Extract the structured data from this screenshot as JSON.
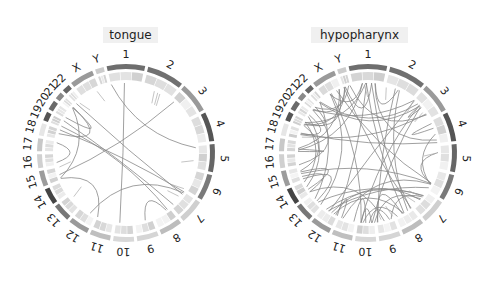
{
  "panels": [
    {
      "title": "tongue",
      "n_links": 14
    },
    {
      "title": "hypopharynx",
      "n_links": 60
    }
  ],
  "chromosomes": [
    "1",
    "2",
    "3",
    "4",
    "5",
    "6",
    "7",
    "8",
    "9",
    "10",
    "11",
    "12",
    "13",
    "14",
    "15",
    "16",
    "17",
    "18",
    "19",
    "20",
    "21",
    "22",
    "X",
    "Y"
  ],
  "chromosome_shades": [
    "#6e6e6e",
    "#707070",
    "#9a9a9a",
    "#555555",
    "#666666",
    "#7a7a7a",
    "#cfcfcf",
    "#bdbdbd",
    "#d5d5d5",
    "#d8d8d8",
    "#bfbfbf",
    "#9a9a9a",
    "#777777",
    "#444444",
    "#9c9c9c",
    "#d0d0d0",
    "#c8c8c8",
    "#e6e6e6",
    "#555555",
    "#6a6a6a",
    "#8a8a8a",
    "#666666",
    "#9a9a9a",
    "#cccccc"
  ],
  "colors": {
    "link": "#888888",
    "title_bg": "#f0f0f0"
  }
}
